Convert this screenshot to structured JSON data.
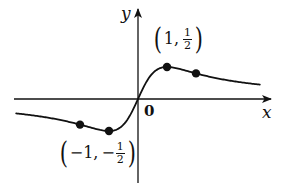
{
  "figure": {
    "function": "x/(x^2+1)",
    "axes": {
      "x_label": "x",
      "y_label": "y",
      "origin_label": "0"
    },
    "annotations": {
      "max_point": {
        "open": "(",
        "x": "1,",
        "num": "1",
        "den": "2",
        "close": ")"
      },
      "min_point": {
        "open": "(",
        "x": "−1,",
        "sign": "−",
        "num": "1",
        "den": "2",
        "close": ")"
      }
    },
    "marked_points": [
      {
        "x": -2,
        "y": -0.4
      },
      {
        "x": -1,
        "y": -0.5
      },
      {
        "x": 1,
        "y": 0.5
      },
      {
        "x": 2,
        "y": 0.4
      }
    ],
    "colors": {
      "ink": "#111111",
      "background": "#ffffff"
    }
  },
  "chart_data": {
    "type": "line",
    "title": "",
    "xlabel": "x",
    "ylabel": "y",
    "series": [
      {
        "name": "f(x) = x/(x^2+1)",
        "x": [
          -4.2,
          -3,
          -2,
          -1.5,
          -1,
          -0.5,
          0,
          0.5,
          1,
          1.5,
          2,
          3,
          4.2
        ],
        "y": [
          -0.225,
          -0.3,
          -0.4,
          -0.462,
          -0.5,
          -0.4,
          0,
          0.4,
          0.5,
          0.462,
          0.4,
          0.3,
          0.225
        ]
      }
    ],
    "annotations": [
      "(1, 1/2)",
      "(-1, -1/2)",
      "0"
    ],
    "xlim": [
      -4.3,
      4.5
    ],
    "ylim": [
      -1.3,
      1.4
    ],
    "grid": false,
    "legend": null
  }
}
